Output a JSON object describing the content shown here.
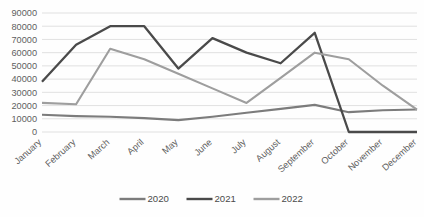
{
  "chart_data": {
    "type": "line",
    "title": "",
    "xlabel": "",
    "ylabel": "",
    "categories": [
      "January",
      "February",
      "March",
      "April",
      "May",
      "June",
      "July",
      "August",
      "September",
      "October",
      "November",
      "December"
    ],
    "ylim": [
      0,
      90000
    ],
    "ytick_labels": [
      "90000",
      "80000",
      "70000",
      "60000",
      "50000",
      "40000",
      "30000",
      "20000",
      "10000",
      "0"
    ],
    "ytick_values": [
      90000,
      80000,
      70000,
      60000,
      50000,
      40000,
      30000,
      20000,
      10000,
      0
    ],
    "grid": true,
    "legend_position": "bottom",
    "series": [
      {
        "name": "2020",
        "color": "#7c7c7c",
        "values": [
          13000,
          12000,
          11500,
          10500,
          9000,
          11500,
          14500,
          17500,
          20500,
          15000,
          16500,
          17000
        ]
      },
      {
        "name": "2021",
        "color": "#4a4a4a",
        "values": [
          38000,
          66000,
          80000,
          80000,
          48000,
          71000,
          60000,
          52000,
          75000,
          0,
          0,
          0
        ]
      },
      {
        "name": "2022",
        "color": "#9e9e9e",
        "values": [
          22000,
          21000,
          63000,
          55000,
          44000,
          33000,
          22000,
          41000,
          60000,
          55000,
          35000,
          17000
        ]
      }
    ]
  },
  "legend": {
    "items": [
      {
        "label": "2020",
        "color": "#7c7c7c"
      },
      {
        "label": "2021",
        "color": "#4a4a4a"
      },
      {
        "label": "2022",
        "color": "#9e9e9e"
      }
    ]
  },
  "colors": {
    "grid": "#d4d4d4",
    "axis_text": "#5f5f5f",
    "legend_text": "#4a4a4a",
    "background": "#fdfdfc"
  }
}
